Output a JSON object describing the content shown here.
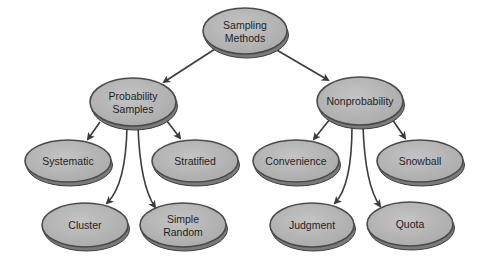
{
  "diagram": {
    "type": "tree",
    "colors": {
      "node_fill": "#b8b8b8",
      "node_rim": "#4a4a4a",
      "node_shadow": "#7a7a7a",
      "edge": "#3a3a3a",
      "text": "#1e1e1e"
    },
    "nodes": [
      {
        "id": "root",
        "lines": [
          "Sampling",
          "Methods"
        ],
        "parent": null
      },
      {
        "id": "probability",
        "lines": [
          "Probability",
          "Samples"
        ],
        "parent": "root"
      },
      {
        "id": "nonprobability",
        "lines": [
          "Nonprobability"
        ],
        "parent": "root"
      },
      {
        "id": "systematic",
        "lines": [
          "Systematic"
        ],
        "parent": "probability"
      },
      {
        "id": "stratified",
        "lines": [
          "Stratified"
        ],
        "parent": "probability"
      },
      {
        "id": "cluster",
        "lines": [
          "Cluster"
        ],
        "parent": "probability"
      },
      {
        "id": "simple-random",
        "lines": [
          "Simple",
          "Random"
        ],
        "parent": "probability"
      },
      {
        "id": "convenience",
        "lines": [
          "Convenience"
        ],
        "parent": "nonprobability"
      },
      {
        "id": "snowball",
        "lines": [
          "Snowball"
        ],
        "parent": "nonprobability"
      },
      {
        "id": "judgment",
        "lines": [
          "Judgment"
        ],
        "parent": "nonprobability"
      },
      {
        "id": "quota",
        "lines": [
          "Quota"
        ],
        "parent": "nonprobability"
      }
    ]
  }
}
